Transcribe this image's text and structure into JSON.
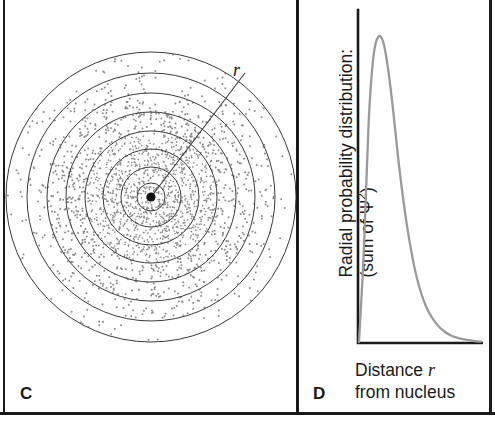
{
  "figure": {
    "panels": [
      {
        "letter": "C",
        "name": "electron-cloud-diagram",
        "annotation_label": "r",
        "description": "concentric shells stipple diagram of electron probability cloud around nucleus"
      },
      {
        "letter": "D",
        "name": "radial-probability-plot",
        "y_axis_line1": "Radial probability distribution:",
        "y_axis_line2_prefix": "(sum of ",
        "y_axis_line2_symbol": "Ψ",
        "y_axis_line2_sup": "2",
        "y_axis_line2_suffix": ")",
        "x_axis_line1_prefix": "Distance ",
        "x_axis_line1_symbol": "r",
        "x_axis_line2": "from nucleus"
      }
    ]
  },
  "chart_data": {
    "type": "line",
    "title": "",
    "xlabel": "Distance r from nucleus",
    "ylabel": "Radial probability distribution: (sum of Ψ²)",
    "series": [
      {
        "name": "radial probability distribution",
        "color": "#9a9a9a",
        "x": [
          0.0,
          0.04,
          0.08,
          0.12,
          0.16,
          0.2,
          0.24,
          0.28,
          0.32,
          0.36,
          0.4,
          0.45,
          0.5,
          0.55,
          0.6,
          0.65,
          0.7,
          0.75,
          0.8,
          0.85,
          0.9,
          0.95,
          1.0
        ],
        "y": [
          0.0,
          0.3,
          0.72,
          0.93,
          0.99,
          0.97,
          0.88,
          0.75,
          0.6,
          0.47,
          0.36,
          0.25,
          0.17,
          0.115,
          0.078,
          0.052,
          0.034,
          0.022,
          0.014,
          0.009,
          0.006,
          0.003,
          0.001
        ]
      }
    ],
    "xlim": [
      0,
      1
    ],
    "ylim": [
      0,
      1.05
    ],
    "grid": false,
    "legend": false,
    "axis_style": "L-shaped spine, no tick labels"
  },
  "colors": {
    "frame": "#1a1a1a",
    "text": "#1a1a1a",
    "curve": "#9a9a9a",
    "ring_stroke": "#3a3a3a",
    "stipple": "#8c8c8c",
    "background": "#ffffff"
  },
  "shells": {
    "count": 8,
    "radii": [
      14,
      30,
      48,
      66,
      85,
      104,
      124,
      145
    ],
    "densities": [
      1.0,
      0.95,
      0.82,
      0.62,
      0.42,
      0.26,
      0.13,
      0.05
    ]
  }
}
